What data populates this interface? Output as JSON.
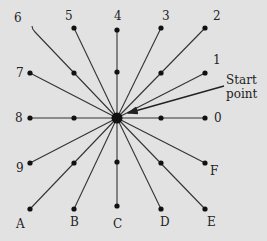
{
  "diagram": {
    "type": "radial-spoke-diagram",
    "center": {
      "x": 117,
      "y": 118,
      "label": "start-point"
    },
    "annotation": {
      "line1": "Start",
      "line2": "point"
    },
    "spokes": [
      {
        "label": "0",
        "end": [
          205,
          118
        ],
        "mid": [
          161,
          118
        ],
        "label_pos": [
          214,
          122
        ]
      },
      {
        "label": "1",
        "end": [
          205,
          73
        ],
        "mid": null,
        "label_pos": [
          213,
          64
        ]
      },
      {
        "label": "2",
        "end": [
          205,
          28
        ],
        "mid": [
          161,
          73
        ],
        "label_pos": [
          213,
          20
        ]
      },
      {
        "label": "3",
        "end": [
          161,
          28
        ],
        "mid": null,
        "label_pos": [
          162,
          20
        ]
      },
      {
        "label": "4",
        "end": [
          117,
          30
        ],
        "mid": [
          117,
          72
        ],
        "label_pos": [
          114,
          20
        ]
      },
      {
        "label": "5",
        "end": [
          74,
          28
        ],
        "mid": [
          74,
          73
        ],
        "label_pos": [
          65,
          20
        ]
      },
      {
        "label": "6",
        "end": [
          32,
          27
        ],
        "mid": null,
        "label_pos": [
          14,
          22
        ],
        "hook": true
      },
      {
        "label": "7",
        "end": [
          30,
          73
        ],
        "mid": null,
        "label_pos": [
          16,
          77
        ]
      },
      {
        "label": "8",
        "end": [
          30,
          118
        ],
        "mid": [
          74,
          118
        ],
        "label_pos": [
          15,
          122
        ]
      },
      {
        "label": "9",
        "end": [
          30,
          163
        ],
        "mid": [
          74,
          163
        ],
        "label_pos": [
          16,
          172
        ]
      },
      {
        "label": "A",
        "end": [
          30,
          209
        ],
        "mid": null,
        "label_pos": [
          16,
          228
        ]
      },
      {
        "label": "B",
        "end": [
          74,
          209
        ],
        "mid": null,
        "label_pos": [
          70,
          226
        ]
      },
      {
        "label": "C",
        "end": [
          117,
          206
        ],
        "mid": [
          117,
          162
        ],
        "label_pos": [
          113,
          228
        ]
      },
      {
        "label": "D",
        "end": [
          161,
          209
        ],
        "mid": null,
        "label_pos": [
          160,
          226
        ]
      },
      {
        "label": "E",
        "end": [
          205,
          209
        ],
        "mid": [
          161,
          163
        ],
        "label_pos": [
          207,
          226
        ]
      },
      {
        "label": "F",
        "end": [
          205,
          163
        ],
        "mid": null,
        "label_pos": [
          210,
          175
        ]
      }
    ]
  }
}
